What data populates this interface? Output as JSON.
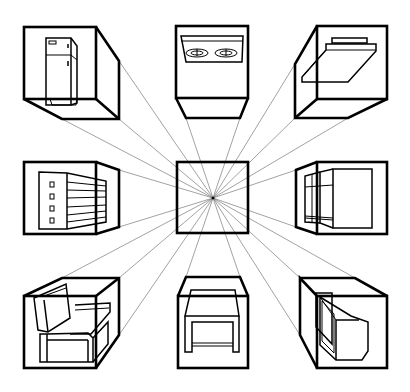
{
  "figure": {
    "title": "One-point perspective: objects in boxes around a central vanishing point",
    "vanishing_point": {
      "x": 213,
      "y": 198
    },
    "colors": {
      "line": "#000000",
      "ray": "#555555",
      "background": "#ffffff"
    },
    "center_box": {
      "label": "center-square"
    },
    "boxes": [
      {
        "position": "top-left",
        "object": "refrigerator"
      },
      {
        "position": "top-center",
        "object": "cooktop-stove"
      },
      {
        "position": "top-right",
        "object": "shelf-slab"
      },
      {
        "position": "middle-left",
        "object": "dresser-cabinet"
      },
      {
        "position": "middle-right",
        "object": "wardrobe-cabinet"
      },
      {
        "position": "bottom-left",
        "object": "armchair"
      },
      {
        "position": "bottom-center",
        "object": "table"
      },
      {
        "position": "bottom-right",
        "object": "television-monitor"
      }
    ]
  }
}
